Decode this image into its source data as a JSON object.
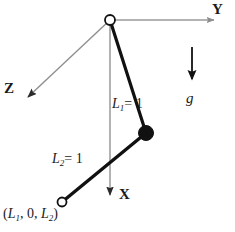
{
  "figure": {
    "type": "diagram",
    "background_color": "#ffffff",
    "axis_color": "#9a9a9a",
    "link_color": "#111111",
    "text_color": "#1a1a1a",
    "axes": [
      {
        "name": "Y",
        "label": "Y",
        "direction": "right",
        "origin": [
          110,
          20
        ],
        "tip": [
          222,
          20
        ]
      },
      {
        "name": "Z",
        "label": "Z",
        "direction": "down-left",
        "origin": [
          110,
          20
        ],
        "tip": [
          22,
          103
        ]
      },
      {
        "name": "X",
        "label": "X",
        "direction": "down",
        "origin": [
          110,
          20
        ],
        "tip": [
          110,
          203
        ]
      }
    ],
    "gravity": {
      "label": "g",
      "arrow_from": [
        192,
        47
      ],
      "arrow_to": [
        192,
        88
      ]
    },
    "links": [
      {
        "name": "L1",
        "label": "L",
        "subscript": "1",
        "equals": "= 1",
        "from": [
          110,
          20
        ],
        "to": [
          146,
          133
        ]
      },
      {
        "name": "L2",
        "label": "L",
        "subscript": "2",
        "equals": "= 1",
        "from": [
          146,
          133
        ],
        "to": [
          62,
          202
        ]
      }
    ],
    "joints": [
      {
        "name": "pivot",
        "style": "open",
        "cx": 110,
        "cy": 20,
        "r": 5
      },
      {
        "name": "mass-bob",
        "style": "filled",
        "cx": 146,
        "cy": 133,
        "r": 7.5
      },
      {
        "name": "end-point",
        "style": "open",
        "cx": 62,
        "cy": 202,
        "r": 4.5
      }
    ],
    "labels": {
      "axis_y": "Y",
      "axis_z": "Z",
      "axis_x": "X",
      "gravity": "g",
      "link1_var": "L",
      "link1_sub": "1",
      "link1_val": "= 1",
      "link2_var": "L",
      "link2_sub": "2",
      "link2_val": "= 1",
      "coordinate_open": "(",
      "coordinate_var1": "L",
      "coordinate_sub1": "1",
      "coordinate_mid": ", 0, ",
      "coordinate_var2": "L",
      "coordinate_sub2": "2",
      "coordinate_close": ")"
    }
  }
}
